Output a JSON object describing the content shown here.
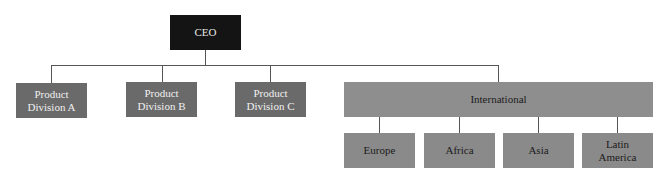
{
  "diagram": {
    "type": "org-chart",
    "root": {
      "label": "CEO"
    },
    "divisions": [
      {
        "label": "Product Division A",
        "line1": "Product",
        "line2": "Division A"
      },
      {
        "label": "Product Division B",
        "line1": "Product",
        "line2": "Division B"
      },
      {
        "label": "Product Division C",
        "line1": "Product",
        "line2": "Division C"
      }
    ],
    "international": {
      "label": "International",
      "regions": [
        {
          "label": "Europe"
        },
        {
          "label": "Africa"
        },
        {
          "label": "Asia"
        },
        {
          "label": "Latin America",
          "line1": "Latin",
          "line2": "America"
        }
      ]
    },
    "colors": {
      "ceo": "#141414",
      "division": "#6a6a6a",
      "international": "#8e8e8e",
      "region": "#8a8a8a",
      "connector": "#555555"
    }
  }
}
